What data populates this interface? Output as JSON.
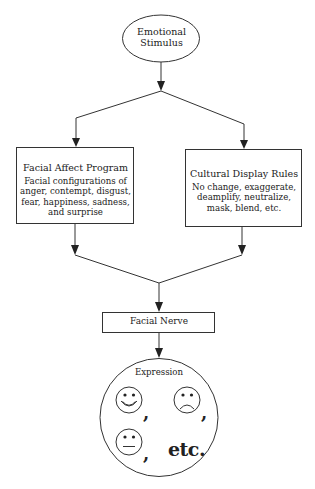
{
  "diagram": {
    "type": "flowchart",
    "nodes": {
      "stimulus": {
        "line1": "Emotional",
        "line2": "Stimulus",
        "shape": "ellipse"
      },
      "affect_program": {
        "title": "Facial Affect Program",
        "lines": [
          "Facial configurations of",
          "anger, contempt, disgust,",
          "fear, happiness,  sadness,",
          "and surprise"
        ],
        "shape": "rectangle"
      },
      "display_rules": {
        "title": "Cultural Display Rules",
        "lines": [
          "No change, exaggerate,",
          "deamplify, neutralize,",
          "mask, blend, etc."
        ],
        "shape": "rectangle"
      },
      "facial_nerve": {
        "title": "Facial Nerve",
        "shape": "rectangle"
      },
      "expression": {
        "title": "Expression",
        "faces": [
          "smiling-face",
          "frowning-face",
          "neutral-face"
        ],
        "separator": ",",
        "etc_label": "etc.",
        "shape": "circle"
      }
    },
    "edges": [
      {
        "from": "stimulus",
        "to": "affect_program"
      },
      {
        "from": "stimulus",
        "to": "display_rules"
      },
      {
        "from": "affect_program",
        "to": "facial_nerve"
      },
      {
        "from": "display_rules",
        "to": "facial_nerve"
      },
      {
        "from": "facial_nerve",
        "to": "expression"
      }
    ],
    "colors": {
      "stroke": "#333333",
      "background": "#ffffff",
      "text": "#222222"
    }
  }
}
